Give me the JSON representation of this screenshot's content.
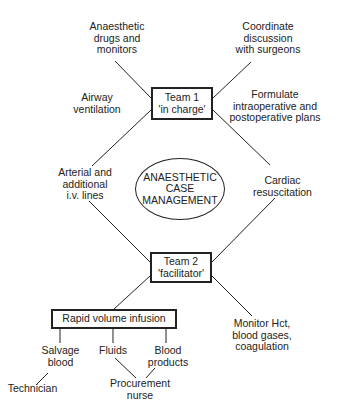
{
  "diagram": {
    "center": {
      "label": "ANAESTHETIC\nCASE\nMANAGEMENT"
    },
    "team1": {
      "label": "Team 1\n'in charge'"
    },
    "team2": {
      "label": "Team 2\n'facilitator'"
    },
    "rapid_infusion": {
      "label": "Rapid volume infusion"
    },
    "nodes": {
      "anaesthetic_drugs": "Anaesthetic\ndrugs and\nmonitors",
      "coordinate_discussion": "Coordinate\ndiscussion\nwith surgeons",
      "airway_ventilation": "Airway\nventilation",
      "formulate_plans": "Formulate\nintraoperative and\npostoperative plans",
      "arterial_lines": "Arterial and\nadditional\ni.v. lines",
      "cardiac_resuscitation": "Cardiac\nresuscitation",
      "monitor_hct": "Monitor Hct,\nblood gases,\ncoagulation",
      "salvage_blood": "Salvage\nblood",
      "fluids": "Fluids",
      "blood_products": "Blood\nproducts",
      "technician": "Technician",
      "procurement_nurse": "Procurement\nnurse"
    },
    "colors": {
      "line": "#222222",
      "background": "#ffffff"
    }
  }
}
